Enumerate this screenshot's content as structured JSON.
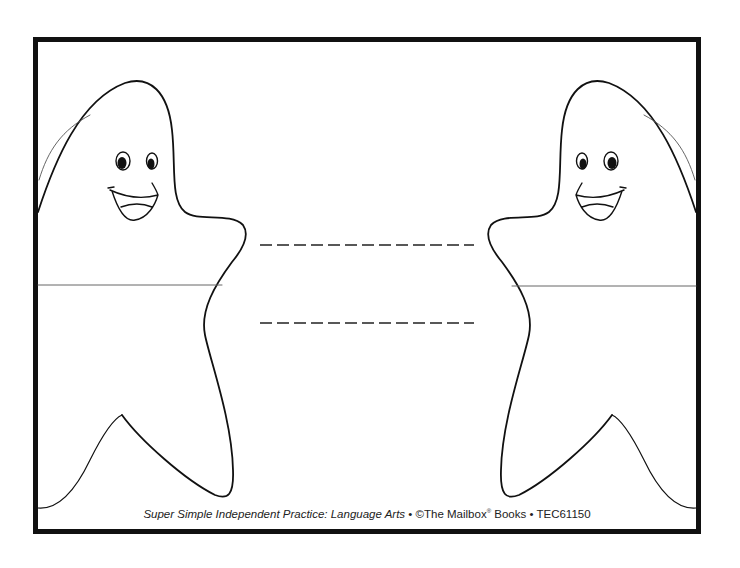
{
  "worksheet": {
    "answer_blanks": [
      {
        "label": "",
        "value": ""
      },
      {
        "label": "",
        "value": ""
      }
    ],
    "characters": [
      {
        "name": "left-star",
        "expression": "smiling",
        "facing": "right"
      },
      {
        "name": "right-star",
        "expression": "smiling",
        "facing": "left"
      }
    ]
  },
  "footer": {
    "title": "Super Simple Independent Practice: Language Arts",
    "separator": "•",
    "copyright": "©The Mailbox",
    "registered": "®",
    "publisher_suffix": "Books",
    "code": "TEC61150"
  },
  "colors": {
    "ink": "#111111",
    "background": "#ffffff"
  }
}
